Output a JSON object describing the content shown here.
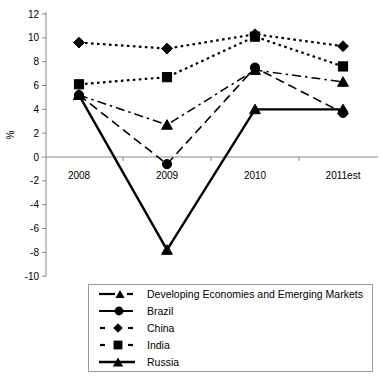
{
  "chart_data": {
    "type": "line",
    "title": "",
    "xlabel": "",
    "ylabel": "%",
    "categories": [
      "2008",
      "2009",
      "2010",
      "2011est"
    ],
    "ylim": [
      -10,
      12
    ],
    "yticks": [
      12,
      10,
      8,
      6,
      4,
      2,
      0,
      -2,
      -4,
      -6,
      -8,
      -10
    ],
    "ytick_labels": [
      "12",
      "10",
      "8",
      "6",
      "4",
      "2",
      "0",
      "-2",
      "-4",
      "-6",
      "-8",
      "-10"
    ],
    "grid": false,
    "legend_position": "bottom",
    "series": [
      {
        "name": "Developing Economies and Emerging Markets",
        "values": [
          5.2,
          2.7,
          7.3,
          6.3
        ],
        "marker": "triangle",
        "line_style": "dash-dot",
        "color": "#000000"
      },
      {
        "name": "Brazil",
        "values": [
          5.2,
          -0.6,
          7.5,
          3.7
        ],
        "marker": "circle",
        "line_style": "dashed",
        "color": "#000000"
      },
      {
        "name": "China",
        "values": [
          9.6,
          9.1,
          10.3,
          9.3
        ],
        "marker": "diamond",
        "line_style": "dotted",
        "color": "#000000"
      },
      {
        "name": "India",
        "values": [
          6.1,
          6.7,
          10.1,
          7.6
        ],
        "marker": "square",
        "line_style": "dotted",
        "color": "#000000"
      },
      {
        "name": "Russia",
        "values": [
          5.2,
          -7.8,
          4.0,
          4.0
        ],
        "marker": "triangle",
        "line_style": "solid",
        "color": "#000000"
      }
    ]
  },
  "legend": {
    "items": [
      {
        "label": "Developing Economies and Emerging Markets"
      },
      {
        "label": "Brazil"
      },
      {
        "label": "China"
      },
      {
        "label": "India"
      },
      {
        "label": "Russia"
      }
    ]
  }
}
